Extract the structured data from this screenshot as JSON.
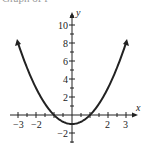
{
  "header": {
    "partial_text": "Graph of f"
  },
  "chart_data": {
    "type": "line",
    "title": "",
    "xlabel": "x",
    "ylabel": "y",
    "function": "y = x^2 - 1",
    "x": [
      -3,
      -2,
      -1,
      0,
      1,
      2,
      3
    ],
    "series": [
      {
        "name": "y = x^2 - 1",
        "values": [
          8,
          3,
          0,
          -1,
          0,
          3,
          8
        ]
      }
    ],
    "xlim": [
      -3.5,
      3.5
    ],
    "ylim": [
      -3,
      11
    ],
    "x_tick_labels": [
      "-3",
      "-2",
      "2",
      "3"
    ],
    "y_tick_labels": [
      "10",
      "8",
      "6",
      "4",
      "2",
      "-2"
    ],
    "grid": false,
    "color": "#222222"
  }
}
